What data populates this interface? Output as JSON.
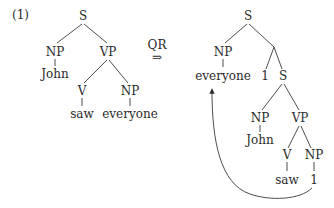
{
  "example_number": "(1)",
  "transformation": {
    "label": "QR",
    "arrow": "⇒"
  },
  "left_tree": {
    "root": "S",
    "np_subject": "NP",
    "subject_word": "John",
    "vp": "VP",
    "verb_cat": "V",
    "verb_word": "saw",
    "np_object": "NP",
    "object_word": "everyone"
  },
  "right_tree": {
    "root": "S",
    "np_raised": "NP",
    "raised_word": "everyone",
    "binder_index": "1",
    "inner_s": "S",
    "np_subject": "NP",
    "subject_word": "John",
    "vp": "VP",
    "verb_cat": "V",
    "verb_word": "saw",
    "np_trace": "NP",
    "trace_index": "1"
  },
  "movement_arrow": {
    "from": "trace 1",
    "to": "everyone"
  }
}
